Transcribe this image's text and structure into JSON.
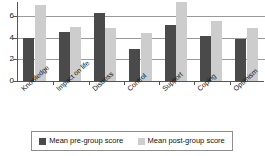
{
  "chart_data": {
    "type": "bar",
    "title": "",
    "xlabel": "",
    "ylabel": "",
    "categories": [
      "Knowledge",
      "Impact on life",
      "Distress",
      "Control",
      "Support",
      "Coping",
      "Optimism"
    ],
    "series": [
      {
        "name": "Mean pre-group score",
        "color": "#4a4a4a",
        "values": [
          4.0,
          4.5,
          6.3,
          3.0,
          5.2,
          4.2,
          3.9
        ]
      },
      {
        "name": "Mean post-group score",
        "color": "#cdcdcd",
        "values": [
          7.0,
          5.0,
          4.9,
          4.4,
          7.3,
          5.5,
          4.9
        ]
      }
    ],
    "yticks": [
      0,
      2,
      4,
      6
    ],
    "ytick_labels": [
      "0",
      "2",
      "4",
      "6"
    ],
    "ylim": [
      0,
      7.6
    ],
    "grid": true,
    "legend_position": "bottom"
  },
  "legend": {
    "items": [
      {
        "label": "Mean pre-group score",
        "color": "#4a4a4a"
      },
      {
        "label": "Mean post-group score",
        "color": "#cdcdcd"
      }
    ]
  }
}
